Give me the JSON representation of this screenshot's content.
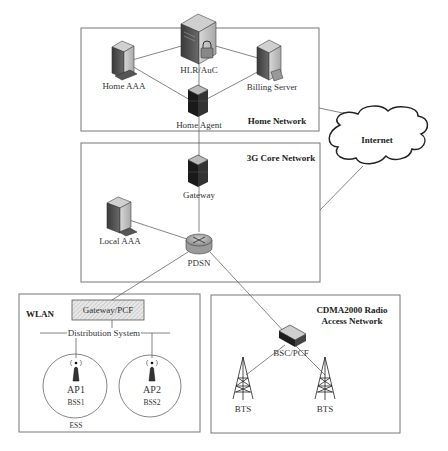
{
  "diagram": {
    "groups": {
      "home_network": "Home Network",
      "core_network": "3G Core Network",
      "wlan": "WLAN",
      "cdma_line1": "CDMA2000 Radio",
      "cdma_line2": "Access Network"
    },
    "nodes": {
      "hlr_auc": "HLR/AuC",
      "home_aaa": "Home AAA",
      "billing_server": "Billing Server",
      "home_agent": "Home Agent",
      "gateway": "Gateway",
      "local_aaa": "Local AAA",
      "pdsn": "PDSN",
      "internet": "Internet",
      "gateway_pcf": "Gateway/PCF",
      "distribution_system": "Distribution System",
      "ap1": "AP1",
      "bss1": "BSS1",
      "ap2": "AP2",
      "bss2": "BSS2",
      "ess": "ESS",
      "bsc_pcf": "BSC/PCF",
      "bts1": "BTS",
      "bts2": "BTS"
    },
    "icons": {
      "hlr_auc": "server-lock-icon",
      "home_aaa": "server-keyboard-icon",
      "billing_server": "server-card-icon",
      "home_agent": "dark-tower-server-icon",
      "gateway": "dark-tower-server-icon",
      "local_aaa": "server-keyboard-icon",
      "pdsn": "router-icon",
      "internet": "cloud-icon",
      "ap": "wireless-access-point-icon",
      "bsc_pcf": "switch-device-icon",
      "bts": "radio-tower-icon"
    },
    "colors": {
      "border": "#777777",
      "line": "#666666",
      "text": "#333333",
      "dark_device": "#1a1a1a",
      "hatch": "#bbbbbb"
    }
  }
}
